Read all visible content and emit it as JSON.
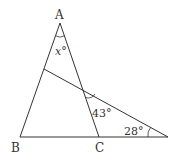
{
  "diagram": {
    "type": "geometry",
    "points": {
      "A": {
        "label": "A",
        "x": 60,
        "y": 23
      },
      "B": {
        "label": "B",
        "x": 20,
        "y": 137
      },
      "C": {
        "label": "C",
        "x": 99,
        "y": 137
      },
      "D": {
        "label": "",
        "x": 168,
        "y": 137
      },
      "E": {
        "label": "",
        "x": 44,
        "y": 69
      }
    },
    "angles": {
      "at_A": "x°",
      "at_intersection": "43°",
      "at_D": "28°"
    },
    "color": "#333333"
  }
}
